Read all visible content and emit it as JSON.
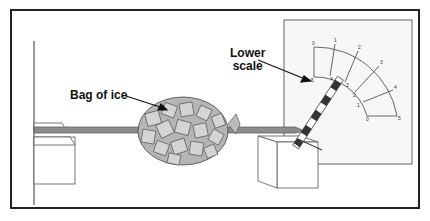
{
  "labels": {
    "bag": "Bag of ice",
    "scale_line1": "Lower",
    "scale_line2": "scale"
  },
  "scale": {
    "outer_ticks": [
      "0",
      "1",
      "2",
      "3",
      "4",
      "5"
    ],
    "inner_ticks": [
      "5",
      "4",
      "3",
      "2",
      "1",
      "0"
    ]
  },
  "colors": {
    "frame": "#222222",
    "beam": "#8c8c8c",
    "bag_fill": "#b5b5b5",
    "panel_bg": "#f5f5f5"
  }
}
